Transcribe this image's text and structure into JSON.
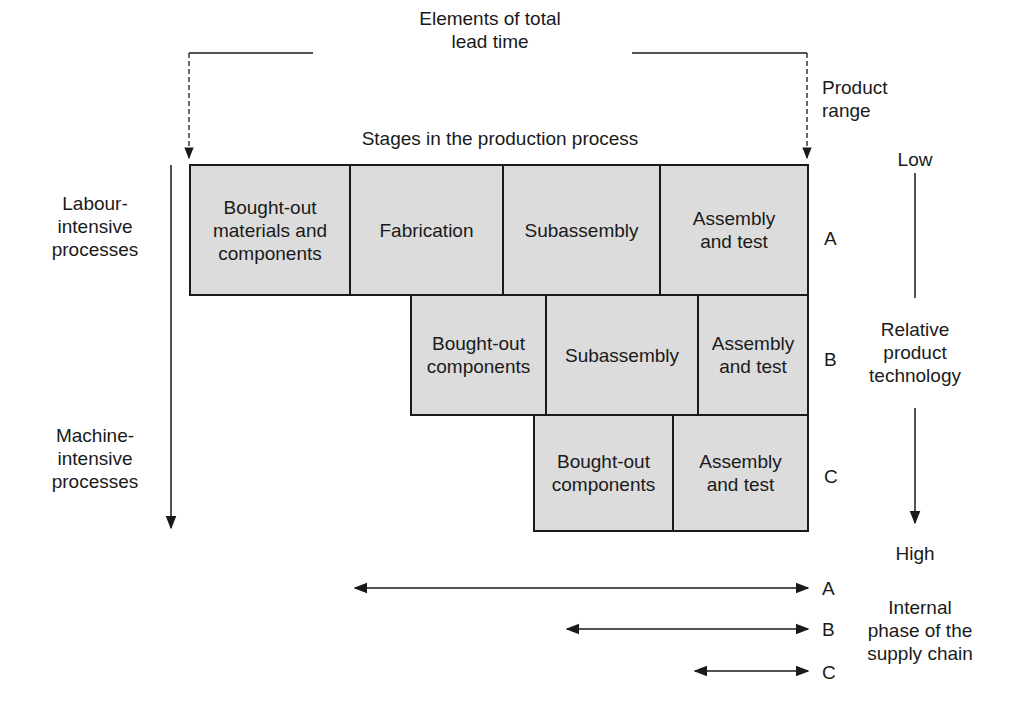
{
  "header": {
    "total_lead_time": "Elements of total\nlead time",
    "stages": "Stages in the production process",
    "product_range": "Product\nrange"
  },
  "left_axis": {
    "top": "Labour-\nintensive\nprocesses",
    "bottom": "Machine-\nintensive\nprocesses"
  },
  "right_axis": {
    "low": "Low",
    "label": "Relative\nproduct\ntechnology",
    "high": "High"
  },
  "rows": [
    {
      "id": "A",
      "cells": [
        "Bought-out\nmaterials and\ncomponents",
        "Fabrication",
        "Subassembly",
        "Assembly\nand test"
      ]
    },
    {
      "id": "B",
      "cells": [
        "Bought-out\ncomponents",
        "Subassembly",
        "Assembly\nand test"
      ]
    },
    {
      "id": "C",
      "cells": [
        "Bought-out\ncomponents",
        "Assembly\nand test"
      ]
    }
  ],
  "supply_chain": {
    "label": "Internal\nphase of the\nsupply chain",
    "arrows": [
      "A",
      "B",
      "C"
    ]
  },
  "colors": {
    "box_fill": "#dcdcdc",
    "line": "#1a1a1a"
  }
}
